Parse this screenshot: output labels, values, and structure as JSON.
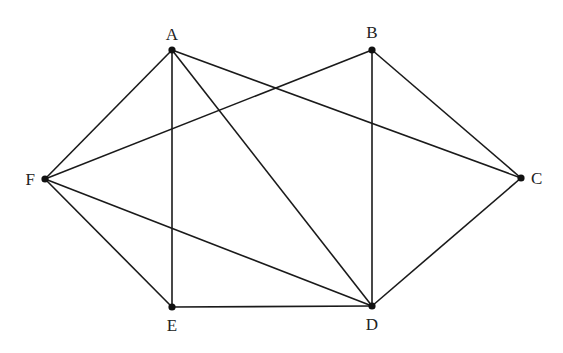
{
  "diagram": {
    "type": "graph",
    "vertices": [
      {
        "id": "A",
        "label": "A",
        "x": 172,
        "y": 50,
        "lx": 172,
        "ly": 40,
        "anchor": "middle"
      },
      {
        "id": "B",
        "label": "B",
        "x": 372,
        "y": 50,
        "lx": 372,
        "ly": 38,
        "anchor": "middle"
      },
      {
        "id": "C",
        "label": "C",
        "x": 521,
        "y": 178,
        "lx": 531,
        "ly": 184,
        "anchor": "start"
      },
      {
        "id": "D",
        "label": "D",
        "x": 372,
        "y": 306,
        "lx": 372,
        "ly": 330,
        "anchor": "middle"
      },
      {
        "id": "E",
        "label": "E",
        "x": 172,
        "y": 307,
        "lx": 172,
        "ly": 331,
        "anchor": "middle"
      },
      {
        "id": "F",
        "label": "F",
        "x": 45,
        "y": 179,
        "lx": 35,
        "ly": 185,
        "anchor": "end"
      }
    ],
    "edges": [
      [
        "A",
        "F"
      ],
      [
        "A",
        "E"
      ],
      [
        "A",
        "D"
      ],
      [
        "A",
        "C"
      ],
      [
        "B",
        "F"
      ],
      [
        "B",
        "D"
      ],
      [
        "B",
        "C"
      ],
      [
        "C",
        "D"
      ],
      [
        "D",
        "E"
      ],
      [
        "D",
        "F"
      ],
      [
        "E",
        "F"
      ]
    ]
  }
}
